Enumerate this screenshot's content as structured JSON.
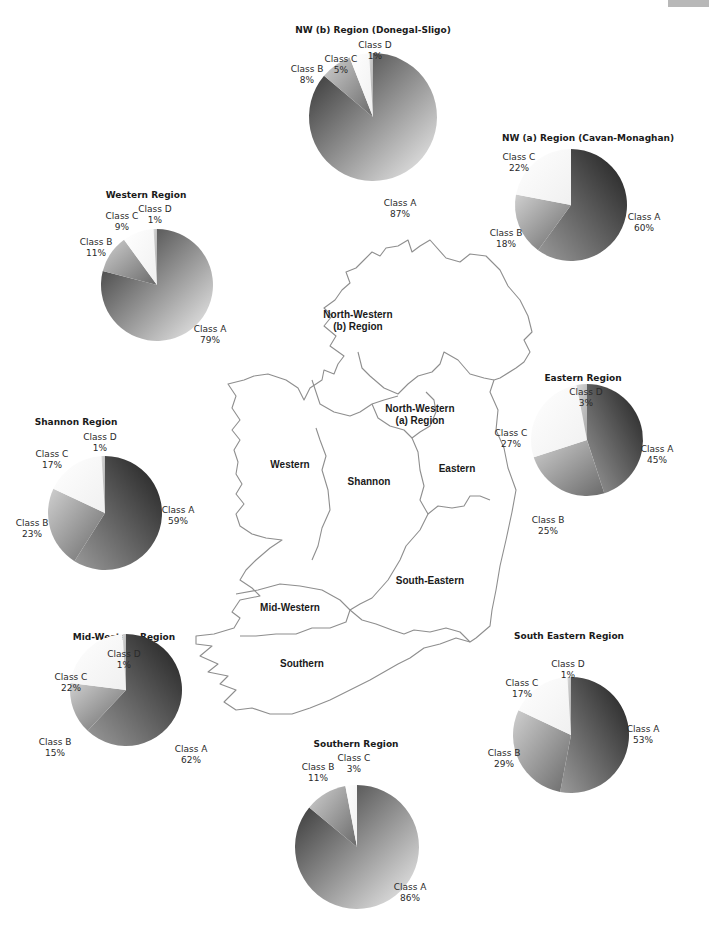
{
  "chart_data": [
    {
      "type": "pie",
      "title": "NW (b) Region (Donegal-Sligo)",
      "categories": [
        "Class A",
        "Class B",
        "Class C",
        "Class D"
      ],
      "values": [
        87,
        8,
        5,
        1
      ]
    },
    {
      "type": "pie",
      "title": "NW (a) Region (Cavan-Monaghan)",
      "categories": [
        "Class A",
        "Class B",
        "Class C"
      ],
      "values": [
        60,
        18,
        22
      ]
    },
    {
      "type": "pie",
      "title": "Western Region",
      "categories": [
        "Class A",
        "Class B",
        "Class C",
        "Class D"
      ],
      "values": [
        79,
        11,
        9,
        1
      ]
    },
    {
      "type": "pie",
      "title": "Eastern Region",
      "categories": [
        "Class A",
        "Class B",
        "Class C",
        "Class D"
      ],
      "values": [
        45,
        25,
        27,
        3
      ]
    },
    {
      "type": "pie",
      "title": "Shannon Region",
      "categories": [
        "Class A",
        "Class B",
        "Class C",
        "Class D"
      ],
      "values": [
        59,
        23,
        17,
        1
      ]
    },
    {
      "type": "pie",
      "title": "Mid-Western Region",
      "categories": [
        "Class A",
        "Class B",
        "Class C",
        "Class D"
      ],
      "values": [
        62,
        15,
        22,
        1
      ]
    },
    {
      "type": "pie",
      "title": "Southern Region",
      "categories": [
        "Class A",
        "Class B",
        "Class C"
      ],
      "values": [
        86,
        11,
        3
      ]
    },
    {
      "type": "pie",
      "title": "South Eastern Region",
      "categories": [
        "Class A",
        "Class B",
        "Class C",
        "Class D"
      ],
      "values": [
        53,
        29,
        17,
        1
      ]
    }
  ],
  "pies": [
    {
      "id": "nwb",
      "title": "NW (b) Region (Donegal-Sligo)",
      "cx": 373,
      "cy": 117,
      "r": 64,
      "title_x": 373,
      "title_y": 33,
      "slices": [
        {
          "name": "Class A",
          "value": 87,
          "label": "Class A",
          "pct": "87%",
          "lx": 400,
          "ly": 206
        },
        {
          "name": "Class B",
          "value": 8,
          "label": "Class B",
          "pct": "8%",
          "lx": 307,
          "ly": 72
        },
        {
          "name": "Class C",
          "value": 5,
          "label": "Class C",
          "pct": "5%",
          "lx": 341,
          "ly": 62
        },
        {
          "name": "Class D",
          "value": 1,
          "label": "Class D",
          "pct": "1%",
          "lx": 375,
          "ly": 48
        }
      ]
    },
    {
      "id": "nwa",
      "title": "NW (a) Region (Cavan-Monaghan)",
      "cx": 571,
      "cy": 205,
      "r": 56,
      "title_x": 588,
      "title_y": 141,
      "slices": [
        {
          "name": "Class A",
          "value": 60,
          "label": "Class A",
          "pct": "60%",
          "lx": 644,
          "ly": 220
        },
        {
          "name": "Class B",
          "value": 18,
          "label": "Class B",
          "pct": "18%",
          "lx": 506,
          "ly": 236
        },
        {
          "name": "Class C",
          "value": 22,
          "label": "Class C",
          "pct": "22%",
          "lx": 519,
          "ly": 160
        }
      ]
    },
    {
      "id": "western",
      "title": "Western Region",
      "cx": 157,
      "cy": 285,
      "r": 56,
      "title_x": 146,
      "title_y": 198,
      "slices": [
        {
          "name": "Class A",
          "value": 79,
          "label": "Class A",
          "pct": "79%",
          "lx": 210,
          "ly": 332
        },
        {
          "name": "Class B",
          "value": 11,
          "label": "Class B",
          "pct": "11%",
          "lx": 96,
          "ly": 245
        },
        {
          "name": "Class C",
          "value": 9,
          "label": "Class C",
          "pct": "9%",
          "lx": 122,
          "ly": 219
        },
        {
          "name": "Class D",
          "value": 1,
          "label": "Class D",
          "pct": "1%",
          "lx": 155,
          "ly": 212
        }
      ]
    },
    {
      "id": "eastern",
      "title": "Eastern Region",
      "cx": 587,
      "cy": 440,
      "r": 56,
      "title_x": 583,
      "title_y": 381,
      "slices": [
        {
          "name": "Class A",
          "value": 45,
          "label": "Class A",
          "pct": "45%",
          "lx": 657,
          "ly": 452
        },
        {
          "name": "Class B",
          "value": 25,
          "label": "Class B",
          "pct": "25%",
          "lx": 548,
          "ly": 523
        },
        {
          "name": "Class C",
          "value": 27,
          "label": "Class C",
          "pct": "27%",
          "lx": 511,
          "ly": 436
        },
        {
          "name": "Class D",
          "value": 3,
          "label": "Class D",
          "pct": "3%",
          "lx": 586,
          "ly": 395
        }
      ]
    },
    {
      "id": "shannon",
      "title": "Shannon Region",
      "cx": 105,
      "cy": 513,
      "r": 57,
      "title_x": 76,
      "title_y": 425,
      "slices": [
        {
          "name": "Class A",
          "value": 59,
          "label": "Class A",
          "pct": "59%",
          "lx": 178,
          "ly": 513
        },
        {
          "name": "Class B",
          "value": 23,
          "label": "Class B",
          "pct": "23%",
          "lx": 32,
          "ly": 526
        },
        {
          "name": "Class C",
          "value": 17,
          "label": "Class C",
          "pct": "17%",
          "lx": 52,
          "ly": 457
        },
        {
          "name": "Class D",
          "value": 1,
          "label": "Class D",
          "pct": "1%",
          "lx": 100,
          "ly": 440
        }
      ]
    },
    {
      "id": "midwestern",
      "title": "Mid-Western Region",
      "cx": 126,
      "cy": 690,
      "r": 56,
      "title_x": 124,
      "title_y": 640,
      "slices": [
        {
          "name": "Class A",
          "value": 62,
          "label": "Class A",
          "pct": "62%",
          "lx": 191,
          "ly": 752
        },
        {
          "name": "Class B",
          "value": 15,
          "label": "Class B",
          "pct": "15%",
          "lx": 55,
          "ly": 745
        },
        {
          "name": "Class C",
          "value": 22,
          "label": "Class C",
          "pct": "22%",
          "lx": 71,
          "ly": 680
        },
        {
          "name": "Class D",
          "value": 1,
          "label": "Class D",
          "pct": "1%",
          "lx": 124,
          "ly": 657
        }
      ]
    },
    {
      "id": "southern",
      "title": "Southern Region",
      "cx": 357,
      "cy": 847,
      "r": 62,
      "title_x": 356,
      "title_y": 747,
      "slices": [
        {
          "name": "Class A",
          "value": 86,
          "label": "Class A",
          "pct": "86%",
          "lx": 410,
          "ly": 890
        },
        {
          "name": "Class B",
          "value": 11,
          "label": "Class B",
          "pct": "11%",
          "lx": 318,
          "ly": 770
        },
        {
          "name": "Class C",
          "value": 3,
          "label": "Class C",
          "pct": "3%",
          "lx": 354,
          "ly": 761
        }
      ]
    },
    {
      "id": "southeastern",
      "title": "South Eastern Region",
      "cx": 571,
      "cy": 735,
      "r": 58,
      "title_x": 569,
      "title_y": 639,
      "slices": [
        {
          "name": "Class A",
          "value": 53,
          "label": "Class A",
          "pct": "53%",
          "lx": 643,
          "ly": 732
        },
        {
          "name": "Class B",
          "value": 29,
          "label": "Class B",
          "pct": "29%",
          "lx": 504,
          "ly": 756
        },
        {
          "name": "Class C",
          "value": 17,
          "label": "Class C",
          "pct": "17%",
          "lx": 522,
          "ly": 686
        },
        {
          "name": "Class D",
          "value": 1,
          "label": "Class D",
          "pct": "1%",
          "lx": 568,
          "ly": 667
        }
      ]
    }
  ],
  "map_labels": [
    {
      "text": "North-Western",
      "x": 358,
      "y": 318
    },
    {
      "text": "(b) Region",
      "x": 358,
      "y": 330
    },
    {
      "text": "North-Western",
      "x": 420,
      "y": 412
    },
    {
      "text": "(a) Region",
      "x": 420,
      "y": 424
    },
    {
      "text": "Western",
      "x": 290,
      "y": 468
    },
    {
      "text": "Shannon",
      "x": 369,
      "y": 485
    },
    {
      "text": "Eastern",
      "x": 457,
      "y": 472
    },
    {
      "text": "South-Eastern",
      "x": 430,
      "y": 584
    },
    {
      "text": "Mid-Western",
      "x": 290,
      "y": 611
    },
    {
      "text": "Southern",
      "x": 302,
      "y": 667
    }
  ],
  "colors": {
    "background": "#ffffff",
    "map_stroke": "#8e8e8e",
    "tab": "#b8b8b8"
  }
}
